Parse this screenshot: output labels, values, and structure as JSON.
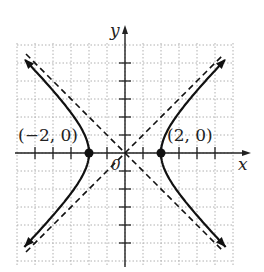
{
  "chart_data": {
    "type": "line",
    "title": "",
    "equation": "x^2/4 - y^2/4 = 1",
    "xlabel": "x",
    "ylabel": "y",
    "xlim": [
      -6,
      6
    ],
    "ylim": [
      -6,
      6
    ],
    "grid": true,
    "tick_step": 1,
    "series": [
      {
        "name": "hyperbola-right-branch",
        "style": "solid",
        "a": 2,
        "b": 2,
        "center": [
          0,
          0
        ],
        "branch": "right"
      },
      {
        "name": "hyperbola-left-branch",
        "style": "solid",
        "a": 2,
        "b": 2,
        "center": [
          0,
          0
        ],
        "branch": "left"
      },
      {
        "name": "asymptote-y=x",
        "style": "dashed",
        "slope": 1,
        "intercept": 0
      },
      {
        "name": "asymptote-y=-x",
        "style": "dashed",
        "slope": -1,
        "intercept": 0
      }
    ],
    "points": [
      {
        "x": -2,
        "y": 0,
        "label": "(−2, 0)"
      },
      {
        "x": 2,
        "y": 0,
        "label": "(2, 0)"
      }
    ],
    "origin_label": "0"
  },
  "labels": {
    "x_axis": "x",
    "y_axis": "y",
    "vertex_left": "(−2, 0)",
    "vertex_right": "(2, 0)",
    "origin": "0"
  },
  "colors": {
    "curve": "#111111",
    "grid": "#b0b0b0",
    "axis": "#222222"
  }
}
